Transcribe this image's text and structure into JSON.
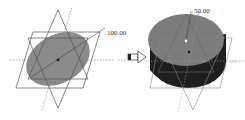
{
  "diagram": {
    "left": {
      "label": "sketch-ellipse",
      "dimension": "100.00"
    },
    "arrow": {
      "label": "transform-arrow"
    },
    "right": {
      "label": "extruded-cylinder",
      "dimension": "50.00",
      "side_label": "DIL1"
    },
    "colors": {
      "sketch_fill": "#8a8a8a",
      "cylinder_top": "#7c7c7c",
      "cylinder_side": "#1e1e1e",
      "lines": "#555555"
    }
  }
}
